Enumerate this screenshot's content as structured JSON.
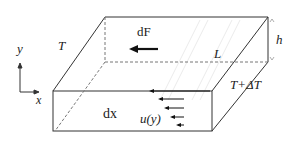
{
  "diagram": {
    "type": "3d-box-flow-schematic",
    "labels": {
      "axis_y": "y",
      "axis_x": "x",
      "temp_top_left": "T",
      "temp_right": "T+ΔT",
      "force": "dF",
      "length": "L",
      "height": "h",
      "element": "dx",
      "velocity": "u(y)"
    },
    "colors": {
      "line": "#333333",
      "dashed": "#777777",
      "hatch": "#e6e6e6",
      "text": "#222222"
    }
  }
}
